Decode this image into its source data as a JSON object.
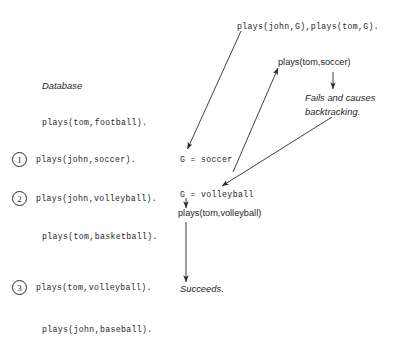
{
  "figure": {
    "kind": "prolog-backtracking-trace-diagram"
  },
  "database": {
    "heading": "Database",
    "facts": [
      {
        "marker": "",
        "text": "plays(tom,football)."
      },
      {
        "marker": "1",
        "text": "plays(john,soccer)."
      },
      {
        "marker": "2",
        "text": "plays(john,volleyball)."
      },
      {
        "marker": "",
        "text": "plays(tom,basketball)."
      },
      {
        "marker": "3",
        "text": "plays(tom,volleyball)."
      },
      {
        "marker": "",
        "text": "plays(john,baseball)."
      }
    ]
  },
  "trace": {
    "query": "plays(john,G),plays(tom,G).",
    "binding_first": "G = soccer",
    "goal_first": "plays(tom,soccer)",
    "fail_note_line1": "Fails and causes",
    "fail_note_line2": "backtracking.",
    "binding_second": "G = volleyball",
    "goal_second": "plays(tom,volleyball)",
    "result": "Succeeds."
  },
  "colors": {
    "ink": "#262626",
    "background": "#ffffff",
    "stroke": "#2b2b2b"
  }
}
